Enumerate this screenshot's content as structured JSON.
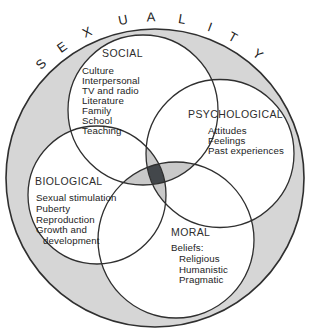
{
  "title": "SEXUALITY",
  "colors": {
    "ring": "#d6d6d6",
    "petal": "#c9c9c9",
    "core": "#43474b",
    "stroke": "#2f2f2f"
  },
  "circles": {
    "social": {
      "label": "SOCIAL",
      "items": [
        "Culture",
        "Interpersonal",
        "TV and radio",
        "Literature",
        "Family",
        "School",
        "Teaching"
      ]
    },
    "psychological": {
      "label": "PSYCHOLOGICAL",
      "items": [
        "Attitudes",
        "Feelings",
        "Past experiences"
      ]
    },
    "biological": {
      "label": "BIOLOGICAL",
      "items": [
        "Sexual stimulation",
        "Puberty",
        "Reproduction",
        "Growth and development"
      ]
    },
    "moral": {
      "label": "MORAL",
      "beliefs_label": "Beliefs:",
      "beliefs": [
        "Religious",
        "Humanistic",
        "Pragmatic"
      ]
    }
  }
}
